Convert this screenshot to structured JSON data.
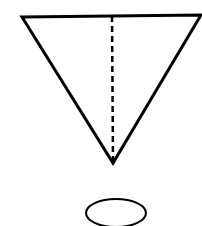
{
  "diagram": {
    "background": "#ffffff",
    "stroke_color": "#000000",
    "triangle": {
      "orientation": "inverted",
      "points": [
        [
          22,
          17
        ],
        [
          201,
          15
        ],
        [
          113,
          163
        ]
      ],
      "stroke_width": 3
    },
    "dashed_line": {
      "x1": 112,
      "y1": 16,
      "x2": 113,
      "y2": 161,
      "stroke_width": 2.5,
      "dash": "6 4"
    },
    "ellipse": {
      "cx": 116,
      "cy": 213,
      "rx": 30,
      "ry": 14,
      "stroke_width": 2
    }
  }
}
